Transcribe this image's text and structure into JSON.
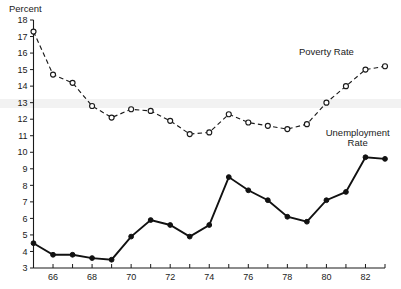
{
  "chart_data": {
    "type": "line",
    "title": "",
    "xlabel": "",
    "ylabel": "Percent",
    "ylim": [
      3,
      18
    ],
    "xlim": [
      1965,
      1983
    ],
    "grid": false,
    "legend_position": "inline-annotation",
    "x": [
      1965,
      1966,
      1967,
      1968,
      1969,
      1970,
      1971,
      1972,
      1973,
      1974,
      1975,
      1976,
      1977,
      1978,
      1979,
      1980,
      1981,
      1982,
      1983
    ],
    "x_tick_labels": [
      "66",
      "68",
      "70",
      "72",
      "74",
      "76",
      "78",
      "80",
      "82"
    ],
    "x_tick_values": [
      1966,
      1968,
      1970,
      1972,
      1974,
      1976,
      1978,
      1980,
      1982
    ],
    "x_minor_tick_values": [
      1965,
      1967,
      1969,
      1971,
      1973,
      1975,
      1977,
      1979,
      1981,
      1983
    ],
    "y_tick_labels": [
      "3",
      "4",
      "5",
      "6",
      "7",
      "8",
      "9",
      "10",
      "11",
      "12",
      "13",
      "14",
      "15",
      "16",
      "17",
      "18"
    ],
    "y_tick_values": [
      3,
      4,
      5,
      6,
      7,
      8,
      9,
      10,
      11,
      12,
      13,
      14,
      15,
      16,
      17,
      18
    ],
    "series": [
      {
        "name": "Poverty Rate",
        "style": "dashed-open-circle",
        "color": "#1a1a1a",
        "values": [
          17.3,
          14.7,
          14.2,
          12.8,
          12.1,
          12.6,
          12.5,
          11.9,
          11.1,
          11.2,
          12.3,
          11.8,
          11.6,
          11.4,
          11.7,
          13.0,
          14.0,
          15.0,
          15.2
        ]
      },
      {
        "name": "Unemployment Rate",
        "style": "solid-filled-circle",
        "color": "#111111",
        "values": [
          4.5,
          3.8,
          3.8,
          3.6,
          3.5,
          4.9,
          5.9,
          5.6,
          4.9,
          5.6,
          8.5,
          7.7,
          7.1,
          6.1,
          5.8,
          7.1,
          7.6,
          9.7,
          9.6
        ]
      }
    ],
    "annotations": [
      {
        "text": "Poverty Rate",
        "x": 1980.0,
        "y": 15.9
      },
      {
        "text": "Unemployment",
        "x": 1981.6,
        "y": 11.0
      },
      {
        "text": "Rate",
        "x": 1981.6,
        "y": 10.4
      }
    ]
  },
  "axis": {
    "y_title": "Percent"
  },
  "colors": {
    "ink": "#1a1a1a",
    "background": "#ffffff",
    "band": "#f2f2f2"
  }
}
